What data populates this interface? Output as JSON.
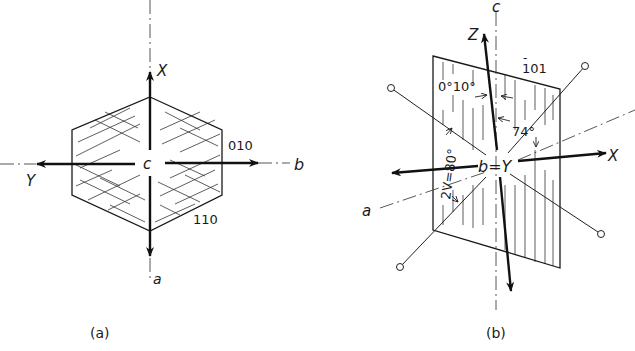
{
  "figure": {
    "panels": [
      {
        "id": "a",
        "caption": "(a)",
        "title": "Crystal section perpendicular to c",
        "axes_labels": {
          "top_arrow": "X",
          "left_arrow": "Y",
          "right_axis": "b",
          "bottom_axis": "a",
          "center": "c"
        },
        "face_labels": {
          "right_face": "010",
          "lower_right_face": "110"
        }
      },
      {
        "id": "b",
        "caption": "(b)",
        "title": "Optic orientation in the (-101) plane",
        "axes_labels": {
          "vertical_axis": "c",
          "top_arrow": "Z",
          "right_arrow": "X",
          "left_axis": "a",
          "center": "b=Y"
        },
        "plane_label": "̅101",
        "plane_label_bar": "-",
        "plane_label_digits": "101",
        "angles": {
          "extinction_range": "0°10°",
          "optic_axis_angle": "2V=80°",
          "x_angle": "74°"
        }
      }
    ]
  },
  "colors": {
    "ink": "#1a1a1a",
    "background": "#ffffff"
  }
}
